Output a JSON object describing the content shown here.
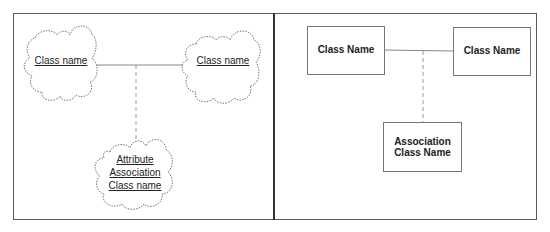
{
  "left_panel": {
    "notation": "cloud",
    "class_a": {
      "label": "Class name"
    },
    "class_b": {
      "label": "Class name"
    },
    "association_class": {
      "lines": [
        "Attribute",
        "Association",
        "Class name"
      ]
    }
  },
  "right_panel": {
    "notation": "rectangle",
    "class_a": {
      "label": "Class Name"
    },
    "class_b": {
      "label": "Class Name"
    },
    "association_class": {
      "label": "Association\nClass Name"
    }
  },
  "colors": {
    "border": "#5a5a5a",
    "divider": "#333333",
    "line": "#888888",
    "text": "#222222"
  }
}
